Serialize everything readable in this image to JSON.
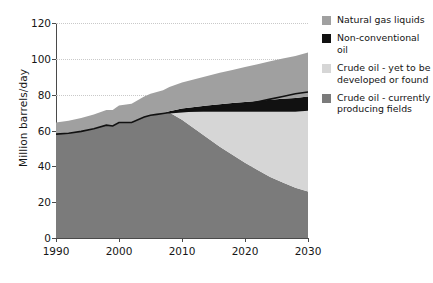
{
  "chart_data": {
    "type": "area",
    "title": "",
    "xlabel": "",
    "ylabel": "Million barrels/day",
    "xlim": [
      1990,
      2030
    ],
    "ylim": [
      0,
      120
    ],
    "xticks": [
      "1990",
      "2000",
      "2010",
      "2020",
      "2030"
    ],
    "yticks": [
      "0",
      "20",
      "40",
      "60",
      "80",
      "100",
      "120"
    ],
    "grid": true,
    "stacked": true,
    "legend_position": "right",
    "x": [
      1990,
      1992,
      1994,
      1996,
      1998,
      1999,
      2000,
      2002,
      2004,
      2005,
      2006,
      2007,
      2008,
      2010,
      2012,
      2014,
      2016,
      2018,
      2020,
      2022,
      2024,
      2026,
      2028,
      2030
    ],
    "series": [
      {
        "name": "Crude oil - currently producing fields",
        "color": "#7b7b7b",
        "values": [
          58,
          58.5,
          59.5,
          61,
          63,
          62.5,
          64.5,
          64.5,
          67.5,
          68.5,
          69,
          69.5,
          70,
          66,
          61,
          56,
          51,
          46.5,
          42,
          38,
          34,
          31,
          28,
          26
        ]
      },
      {
        "name": "Crude oil - yet to be developed or found",
        "color": "#d6d6d6",
        "values": [
          0,
          0,
          0,
          0,
          0,
          0,
          0,
          0,
          0,
          0,
          0,
          0,
          0,
          4.5,
          9.5,
          14.5,
          19.5,
          24,
          28.5,
          32.5,
          36.5,
          39.5,
          42.5,
          45
        ]
      },
      {
        "name": "Non-conventional oil",
        "color": "#111111",
        "values": [
          0,
          0,
          0,
          0,
          0,
          0,
          0,
          0,
          0,
          0,
          0,
          0,
          0.8,
          1.8,
          2.6,
          3.4,
          4.2,
          4.8,
          5.4,
          6,
          6.6,
          7.2,
          7.6,
          8
        ]
      },
      {
        "name": "Natural gas liquids",
        "color": "#a0a0a0",
        "values": [
          6.5,
          7,
          7.5,
          8,
          8.5,
          9,
          9.5,
          10.5,
          11.5,
          12,
          12.5,
          13,
          13.5,
          14.5,
          15.5,
          16.5,
          17.5,
          18.5,
          19.5,
          20.5,
          21.5,
          22.5,
          23.5,
          24.5
        ]
      }
    ],
    "totals": [
      64.5,
      65.5,
      67,
      69,
      71.5,
      71.5,
      74,
      75,
      79,
      80.5,
      81.5,
      82.5,
      84.3,
      86.8,
      88.6,
      90.4,
      92.2,
      93.8,
      95.4,
      97,
      98.6,
      100.2,
      101.6,
      103.5
    ],
    "trend_line": {
      "name": "top of currently producing fields",
      "color": "#111111",
      "values": [
        58,
        58.5,
        59.5,
        61,
        63,
        62.5,
        64.5,
        64.5,
        67.5,
        68.5,
        69,
        69.5,
        70,
        70.5,
        71,
        71.5,
        72.5,
        73.5,
        74.5,
        76,
        77.5,
        79,
        80.5,
        81.5
      ]
    }
  },
  "legend": {
    "items": [
      {
        "label": "Natural gas liquids",
        "color": "#a0a0a0"
      },
      {
        "label": "Non-conventional oil",
        "color": "#111111"
      },
      {
        "label": "Crude oil - yet to be\ndeveloped or found",
        "color": "#d6d6d6"
      },
      {
        "label": "Crude oil - currently\nproducing fields",
        "color": "#7b7b7b"
      }
    ]
  }
}
